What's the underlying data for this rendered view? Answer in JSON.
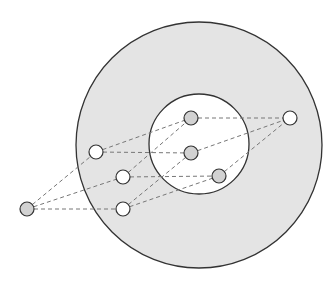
{
  "colors": {
    "background": "#ffffff",
    "outer_fill": "#e4e4e4",
    "inner_fill": "#ffffff",
    "stroke": "#333333",
    "edge": "#777777",
    "node_gray": "#d2d2d2",
    "node_white": "#ffffff"
  },
  "outer_circle": {
    "cx": 199,
    "cy": 145,
    "r": 123
  },
  "inner_circle": {
    "cx": 199,
    "cy": 144,
    "r": 50
  },
  "nodes": [
    {
      "id": "A",
      "x": 27,
      "y": 209,
      "fill": "gray"
    },
    {
      "id": "B",
      "x": 96,
      "y": 152,
      "fill": "white"
    },
    {
      "id": "C",
      "x": 123,
      "y": 177,
      "fill": "white"
    },
    {
      "id": "D",
      "x": 123,
      "y": 209,
      "fill": "white"
    },
    {
      "id": "E",
      "x": 191,
      "y": 118,
      "fill": "gray"
    },
    {
      "id": "F",
      "x": 191,
      "y": 153,
      "fill": "gray"
    },
    {
      "id": "G",
      "x": 219,
      "y": 176,
      "fill": "gray"
    },
    {
      "id": "H",
      "x": 290,
      "y": 118,
      "fill": "white"
    }
  ],
  "node_radius": 7,
  "edges": [
    [
      "A",
      "B"
    ],
    [
      "A",
      "C"
    ],
    [
      "A",
      "D"
    ],
    [
      "B",
      "E"
    ],
    [
      "B",
      "F"
    ],
    [
      "C",
      "E"
    ],
    [
      "C",
      "G"
    ],
    [
      "D",
      "F"
    ],
    [
      "D",
      "G"
    ],
    [
      "E",
      "H"
    ],
    [
      "F",
      "H"
    ],
    [
      "G",
      "H"
    ]
  ]
}
